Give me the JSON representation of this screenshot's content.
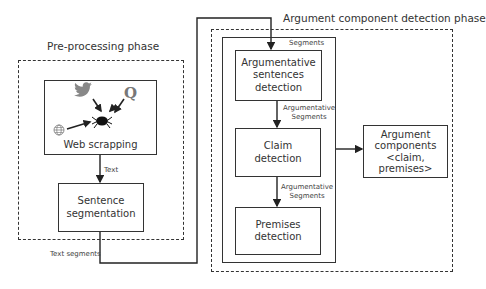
{
  "preprocessing": {
    "title": "Pre-processing phase",
    "web_scrapping": {
      "label": "Web scrapping",
      "icons": [
        "twitter-bird-icon",
        "quora-q-icon",
        "web-globe-icon",
        "spider-crawler-icon"
      ]
    },
    "edge_text": "Text",
    "sentence_segmentation": {
      "label": "Sentence segmentation",
      "lines": [
        "Sentence",
        "segmentation"
      ]
    },
    "output_text": "Text segments"
  },
  "argument_phase": {
    "title": "Argument component detection phase",
    "segments_label": "Segments",
    "argumentative_detection": {
      "lines": [
        "Argumentative",
        "sentences",
        "detection"
      ]
    },
    "edge1": {
      "lines": [
        "Argumentative",
        "Segments"
      ]
    },
    "claim_detection": {
      "lines": [
        "Claim",
        "detection"
      ]
    },
    "edge2": {
      "lines": [
        "Argumentative",
        "Segments"
      ]
    },
    "premises_detection": {
      "lines": [
        "Premises",
        "detection"
      ]
    },
    "output": {
      "lines": [
        "Argument",
        "components",
        "<claim,",
        "premises>"
      ]
    }
  }
}
